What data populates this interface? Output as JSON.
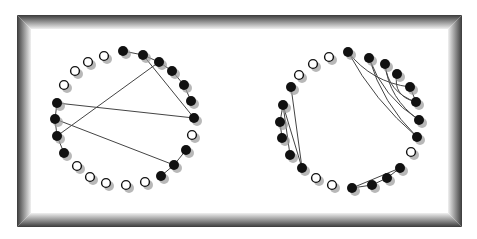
{
  "diagram": {
    "type": "circular-graph-comparison",
    "frame": {
      "x": 17,
      "y": 15,
      "width": 445,
      "height": 212,
      "border_dark": "#3a3a3a",
      "border_light": "#e8e8e8",
      "fill": "#ffffff"
    },
    "node_style": {
      "radius": 5,
      "filled_color": "#111111",
      "open_stroke": "#111111",
      "open_fill": "#ffffff",
      "shadow_color": "#9a9a9a",
      "shadow_offset": [
        3,
        3
      ]
    },
    "edge_style": {
      "color": "#444444",
      "width": 1
    },
    "graphs": [
      {
        "name": "left-graph",
        "nodes": [
          {
            "id": 0,
            "x": 123,
            "y": 51,
            "filled": true
          },
          {
            "id": 1,
            "x": 143,
            "y": 55,
            "filled": true
          },
          {
            "id": 2,
            "x": 159,
            "y": 62,
            "filled": true
          },
          {
            "id": 3,
            "x": 172,
            "y": 71,
            "filled": true
          },
          {
            "id": 4,
            "x": 184,
            "y": 85,
            "filled": true
          },
          {
            "id": 5,
            "x": 191,
            "y": 101,
            "filled": true
          },
          {
            "id": 6,
            "x": 194,
            "y": 118,
            "filled": true
          },
          {
            "id": 7,
            "x": 192,
            "y": 135,
            "filled": false
          },
          {
            "id": 8,
            "x": 186,
            "y": 150,
            "filled": true
          },
          {
            "id": 9,
            "x": 174,
            "y": 165,
            "filled": true
          },
          {
            "id": 10,
            "x": 161,
            "y": 176,
            "filled": true
          },
          {
            "id": 11,
            "x": 145,
            "y": 182,
            "filled": false
          },
          {
            "id": 12,
            "x": 126,
            "y": 185,
            "filled": false
          },
          {
            "id": 13,
            "x": 106,
            "y": 183,
            "filled": false
          },
          {
            "id": 14,
            "x": 90,
            "y": 177,
            "filled": false
          },
          {
            "id": 15,
            "x": 77,
            "y": 166,
            "filled": false
          },
          {
            "id": 16,
            "x": 64,
            "y": 153,
            "filled": true
          },
          {
            "id": 17,
            "x": 57,
            "y": 136,
            "filled": true
          },
          {
            "id": 18,
            "x": 55,
            "y": 119,
            "filled": true
          },
          {
            "id": 19,
            "x": 57,
            "y": 103,
            "filled": true
          },
          {
            "id": 20,
            "x": 64,
            "y": 85,
            "filled": false
          },
          {
            "id": 21,
            "x": 75,
            "y": 71,
            "filled": false
          },
          {
            "id": 22,
            "x": 88,
            "y": 62,
            "filled": false
          },
          {
            "id": 23,
            "x": 104,
            "y": 56,
            "filled": false
          }
        ],
        "edges": [
          {
            "from": 0,
            "to": 1,
            "curved": false
          },
          {
            "from": 1,
            "to": 2,
            "curved": false
          },
          {
            "from": 2,
            "to": 3,
            "curved": false
          },
          {
            "from": 3,
            "to": 4,
            "curved": false
          },
          {
            "from": 4,
            "to": 5,
            "curved": false
          },
          {
            "from": 1,
            "to": 6,
            "curved": false
          },
          {
            "from": 2,
            "to": 17,
            "curved": false
          },
          {
            "from": 19,
            "to": 6,
            "curved": false
          },
          {
            "from": 18,
            "to": 9,
            "curved": false
          },
          {
            "from": 19,
            "to": 18,
            "curved": false
          },
          {
            "from": 18,
            "to": 17,
            "curved": false
          },
          {
            "from": 17,
            "to": 16,
            "curved": false
          },
          {
            "from": 8,
            "to": 9,
            "curved": false
          },
          {
            "from": 9,
            "to": 10,
            "curved": false
          }
        ]
      },
      {
        "name": "right-graph",
        "nodes": [
          {
            "id": 0,
            "x": 348,
            "y": 52,
            "filled": true
          },
          {
            "id": 1,
            "x": 369,
            "y": 58,
            "filled": true
          },
          {
            "id": 2,
            "x": 385,
            "y": 64,
            "filled": true
          },
          {
            "id": 3,
            "x": 397,
            "y": 74,
            "filled": true
          },
          {
            "id": 4,
            "x": 410,
            "y": 87,
            "filled": true
          },
          {
            "id": 5,
            "x": 416,
            "y": 102,
            "filled": true
          },
          {
            "id": 6,
            "x": 419,
            "y": 120,
            "filled": true
          },
          {
            "id": 7,
            "x": 417,
            "y": 137,
            "filled": true
          },
          {
            "id": 8,
            "x": 411,
            "y": 152,
            "filled": false
          },
          {
            "id": 9,
            "x": 400,
            "y": 168,
            "filled": true
          },
          {
            "id": 10,
            "x": 387,
            "y": 178,
            "filled": true
          },
          {
            "id": 11,
            "x": 372,
            "y": 185,
            "filled": true
          },
          {
            "id": 12,
            "x": 352,
            "y": 188,
            "filled": true
          },
          {
            "id": 13,
            "x": 332,
            "y": 185,
            "filled": false
          },
          {
            "id": 14,
            "x": 316,
            "y": 178,
            "filled": false
          },
          {
            "id": 15,
            "x": 302,
            "y": 168,
            "filled": true
          },
          {
            "id": 16,
            "x": 290,
            "y": 155,
            "filled": true
          },
          {
            "id": 17,
            "x": 282,
            "y": 138,
            "filled": true
          },
          {
            "id": 18,
            "x": 280,
            "y": 122,
            "filled": true
          },
          {
            "id": 19,
            "x": 283,
            "y": 105,
            "filled": true
          },
          {
            "id": 20,
            "x": 291,
            "y": 87,
            "filled": true
          },
          {
            "id": 21,
            "x": 299,
            "y": 75,
            "filled": false
          },
          {
            "id": 22,
            "x": 313,
            "y": 64,
            "filled": false
          },
          {
            "id": 23,
            "x": 329,
            "y": 57,
            "filled": false
          }
        ],
        "edges": [
          {
            "from": 0,
            "to": 7,
            "curved": true
          },
          {
            "from": 0,
            "to": 4,
            "curved": true
          },
          {
            "from": 1,
            "to": 7,
            "curved": true
          },
          {
            "from": 1,
            "to": 6,
            "curved": true
          },
          {
            "from": 2,
            "to": 5,
            "curved": true
          },
          {
            "from": 2,
            "to": 6,
            "curved": true
          },
          {
            "from": 3,
            "to": 5,
            "curved": true
          },
          {
            "from": 4,
            "to": 5,
            "curved": false
          },
          {
            "from": 20,
            "to": 15,
            "curved": false
          },
          {
            "from": 19,
            "to": 15,
            "curved": false
          },
          {
            "from": 19,
            "to": 16,
            "curved": false
          },
          {
            "from": 18,
            "to": 17,
            "curved": false
          },
          {
            "from": 19,
            "to": 18,
            "curved": false
          },
          {
            "from": 12,
            "to": 9,
            "curved": false
          },
          {
            "from": 12,
            "to": 11,
            "curved": false
          },
          {
            "from": 11,
            "to": 10,
            "curved": false
          },
          {
            "from": 10,
            "to": 9,
            "curved": false
          }
        ]
      }
    ]
  }
}
